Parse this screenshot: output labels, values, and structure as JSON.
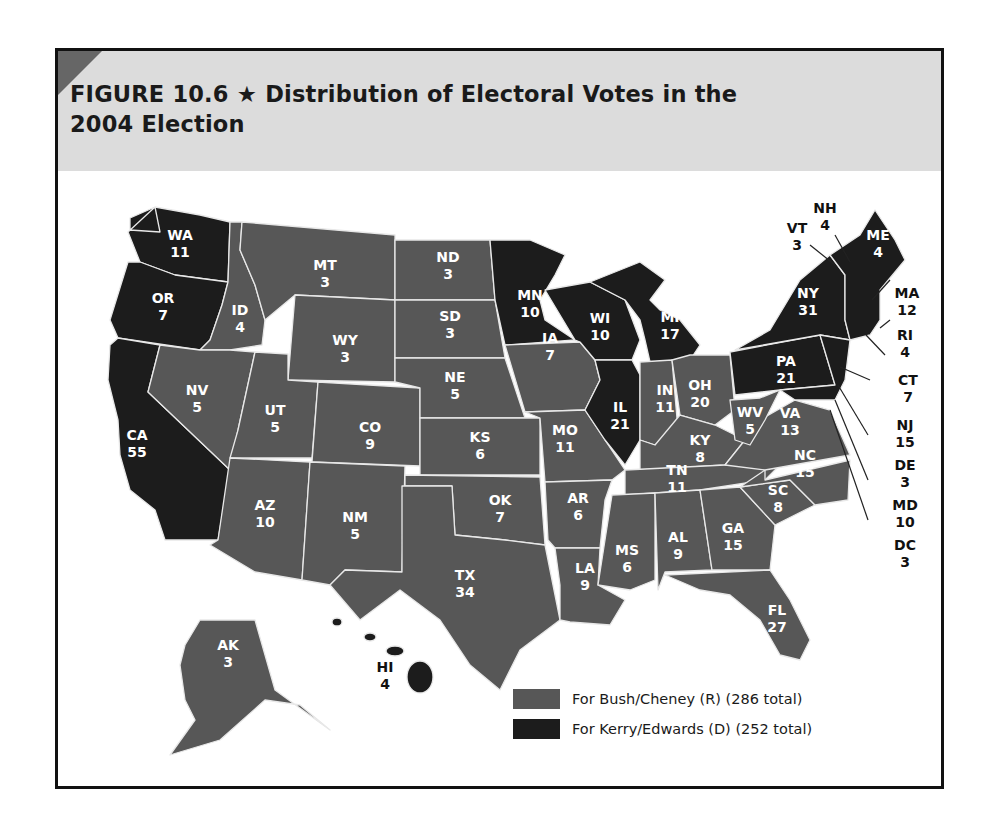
{
  "figure": {
    "title_line1": "FIGURE 10.6 ★  Distribution of Electoral Votes in the",
    "title_line2": "2004 Election"
  },
  "colors": {
    "republican": "#575757",
    "democrat": "#1c1c1c",
    "header_bg": "#dcdcdc",
    "border": "#fff"
  },
  "legend": {
    "republican_label": "For Bush/Cheney (R) (286 total)",
    "democrat_label": "For Kerry/Edwards (D) (252 total)"
  },
  "chart_data": {
    "type": "choropleth-map",
    "title": "FIGURE 10.6 ★ Distribution of Electoral Votes in the 2004 Election",
    "legend": [
      {
        "label": "For Bush/Cheney (R)",
        "total": 286,
        "color": "#575757"
      },
      {
        "label": "For Kerry/Edwards (D)",
        "total": 252,
        "color": "#1c1c1c"
      }
    ],
    "states": [
      {
        "abbr": "WA",
        "votes": 11,
        "party": "D"
      },
      {
        "abbr": "OR",
        "votes": 7,
        "party": "D"
      },
      {
        "abbr": "CA",
        "votes": 55,
        "party": "D"
      },
      {
        "abbr": "ID",
        "votes": 4,
        "party": "R"
      },
      {
        "abbr": "NV",
        "votes": 5,
        "party": "R"
      },
      {
        "abbr": "MT",
        "votes": 3,
        "party": "R"
      },
      {
        "abbr": "WY",
        "votes": 3,
        "party": "R"
      },
      {
        "abbr": "UT",
        "votes": 5,
        "party": "R"
      },
      {
        "abbr": "AZ",
        "votes": 10,
        "party": "R"
      },
      {
        "abbr": "CO",
        "votes": 9,
        "party": "R"
      },
      {
        "abbr": "NM",
        "votes": 5,
        "party": "R"
      },
      {
        "abbr": "ND",
        "votes": 3,
        "party": "R"
      },
      {
        "abbr": "SD",
        "votes": 3,
        "party": "R"
      },
      {
        "abbr": "NE",
        "votes": 5,
        "party": "R"
      },
      {
        "abbr": "KS",
        "votes": 6,
        "party": "R"
      },
      {
        "abbr": "OK",
        "votes": 7,
        "party": "R"
      },
      {
        "abbr": "TX",
        "votes": 34,
        "party": "R"
      },
      {
        "abbr": "MN",
        "votes": 10,
        "party": "D"
      },
      {
        "abbr": "IA",
        "votes": 7,
        "party": "R"
      },
      {
        "abbr": "MO",
        "votes": 11,
        "party": "R"
      },
      {
        "abbr": "AR",
        "votes": 6,
        "party": "R"
      },
      {
        "abbr": "LA",
        "votes": 9,
        "party": "R"
      },
      {
        "abbr": "WI",
        "votes": 10,
        "party": "D"
      },
      {
        "abbr": "IL",
        "votes": 21,
        "party": "D"
      },
      {
        "abbr": "MI",
        "votes": 17,
        "party": "D"
      },
      {
        "abbr": "IN",
        "votes": 11,
        "party": "R"
      },
      {
        "abbr": "OH",
        "votes": 20,
        "party": "R"
      },
      {
        "abbr": "KY",
        "votes": 8,
        "party": "R"
      },
      {
        "abbr": "TN",
        "votes": 11,
        "party": "R"
      },
      {
        "abbr": "MS",
        "votes": 6,
        "party": "R"
      },
      {
        "abbr": "AL",
        "votes": 9,
        "party": "R"
      },
      {
        "abbr": "GA",
        "votes": 15,
        "party": "R"
      },
      {
        "abbr": "FL",
        "votes": 27,
        "party": "R"
      },
      {
        "abbr": "SC",
        "votes": 8,
        "party": "R"
      },
      {
        "abbr": "NC",
        "votes": 15,
        "party": "R"
      },
      {
        "abbr": "VA",
        "votes": 13,
        "party": "R"
      },
      {
        "abbr": "WV",
        "votes": 5,
        "party": "R"
      },
      {
        "abbr": "PA",
        "votes": 21,
        "party": "D"
      },
      {
        "abbr": "NY",
        "votes": 31,
        "party": "D"
      },
      {
        "abbr": "VT",
        "votes": 3,
        "party": "D"
      },
      {
        "abbr": "NH",
        "votes": 4,
        "party": "D"
      },
      {
        "abbr": "ME",
        "votes": 4,
        "party": "D"
      },
      {
        "abbr": "MA",
        "votes": 12,
        "party": "D"
      },
      {
        "abbr": "RI",
        "votes": 4,
        "party": "D"
      },
      {
        "abbr": "CT",
        "votes": 7,
        "party": "D"
      },
      {
        "abbr": "NJ",
        "votes": 15,
        "party": "D"
      },
      {
        "abbr": "DE",
        "votes": 3,
        "party": "D"
      },
      {
        "abbr": "MD",
        "votes": 10,
        "party": "D"
      },
      {
        "abbr": "DC",
        "votes": 3,
        "party": "D"
      },
      {
        "abbr": "AK",
        "votes": 3,
        "party": "R"
      },
      {
        "abbr": "HI",
        "votes": 4,
        "party": "D"
      }
    ]
  },
  "labels": {
    "WA": [
      "WA",
      "11"
    ],
    "OR": [
      "OR",
      "7"
    ],
    "CA": [
      "CA",
      "55"
    ],
    "ID": [
      "ID",
      "4"
    ],
    "NV": [
      "NV",
      "5"
    ],
    "MT": [
      "MT",
      "3"
    ],
    "WY": [
      "WY",
      "3"
    ],
    "UT": [
      "UT",
      "5"
    ],
    "AZ": [
      "AZ",
      "10"
    ],
    "CO": [
      "CO",
      "9"
    ],
    "NM": [
      "NM",
      "5"
    ],
    "ND": [
      "ND",
      "3"
    ],
    "SD": [
      "SD",
      "3"
    ],
    "NE": [
      "NE",
      "5"
    ],
    "KS": [
      "KS",
      "6"
    ],
    "OK": [
      "OK",
      "7"
    ],
    "TX": [
      "TX",
      "34"
    ],
    "MN": [
      "MN",
      "10"
    ],
    "IA": [
      "IA",
      "7"
    ],
    "MO": [
      "MO",
      "11"
    ],
    "AR": [
      "AR",
      "6"
    ],
    "LA": [
      "LA",
      "9"
    ],
    "WI": [
      "WI",
      "10"
    ],
    "IL": [
      "IL",
      "21"
    ],
    "MI": [
      "MI",
      "17"
    ],
    "IN": [
      "IN",
      "11"
    ],
    "OH": [
      "OH",
      "20"
    ],
    "KY": [
      "KY",
      "8"
    ],
    "TN": [
      "TN",
      "11"
    ],
    "MS": [
      "MS",
      "6"
    ],
    "AL": [
      "AL",
      "9"
    ],
    "GA": [
      "GA",
      "15"
    ],
    "FL": [
      "FL",
      "27"
    ],
    "SC": [
      "SC",
      "8"
    ],
    "NC": [
      "NC",
      "15"
    ],
    "VA": [
      "VA",
      "13"
    ],
    "WV": [
      "WV",
      "5"
    ],
    "PA": [
      "PA",
      "21"
    ],
    "NY": [
      "NY",
      "31"
    ],
    "ME": [
      "ME",
      "4"
    ],
    "AK": [
      "AK",
      "3"
    ],
    "VT": [
      "VT",
      "3"
    ],
    "NH": [
      "NH",
      "4"
    ],
    "MA": [
      "MA",
      "12"
    ],
    "RI": [
      "RI",
      "4"
    ],
    "CT": [
      "CT",
      "7"
    ],
    "NJ": [
      "NJ",
      "15"
    ],
    "DE": [
      "DE",
      "3"
    ],
    "MD": [
      "MD",
      "10"
    ],
    "DC": [
      "DC",
      "3"
    ],
    "HI": [
      "HI",
      "4"
    ]
  }
}
